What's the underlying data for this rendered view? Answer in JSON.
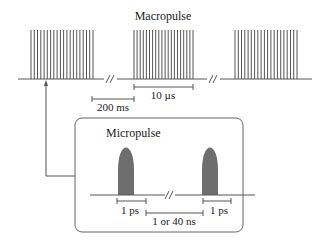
{
  "diagram": {
    "macropulse": {
      "title": "Macropulse",
      "groups": 3,
      "pulses_per_group": 20,
      "duration_label": "10 µs",
      "spacing_label": "200 ms"
    },
    "micropulse": {
      "title": "Micropulse",
      "width_label_left": "1 ps",
      "width_label_right": "1 ps",
      "spacing_label": "1 or 40 ns"
    },
    "colors": {
      "line": "#555555",
      "pulse_fill": "#6e6e6e",
      "box_border": "#666666"
    }
  }
}
